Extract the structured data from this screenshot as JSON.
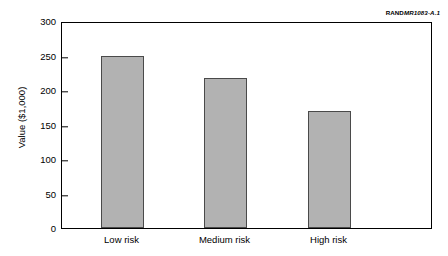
{
  "credit": {
    "org": "RAND",
    "document_id": "MR1083-A.1"
  },
  "chart_data": {
    "type": "bar",
    "title": "",
    "subtitle": "",
    "xlabel": "",
    "ylabel": "Value ($1,000)",
    "categories": [
      "Low risk",
      "Medium risk",
      "High risk"
    ],
    "values": [
      250,
      217,
      170
    ],
    "series": [
      {
        "name": "Value",
        "values": [
          250,
          217,
          170
        ]
      }
    ],
    "ylim": [
      0,
      300
    ],
    "yticks": [
      0,
      50,
      100,
      150,
      200,
      250,
      300
    ],
    "ytick_labels": [
      "0",
      "50",
      "100",
      "150",
      "200",
      "250",
      "300"
    ],
    "grid": false,
    "legend": false,
    "legend_position": "none",
    "bar_color": "#b2b2b2",
    "bar_edge_color": "#4a4a4a",
    "axis_color": "#000000",
    "background": "#ffffff",
    "annotations": []
  }
}
